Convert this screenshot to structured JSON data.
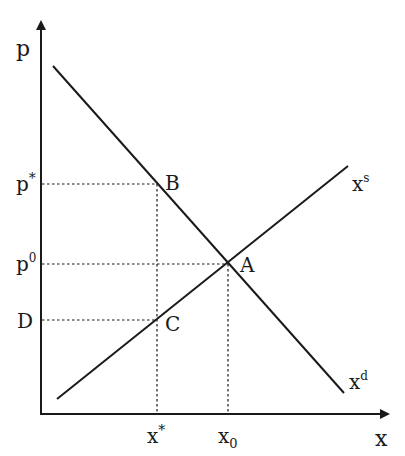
{
  "diagram": {
    "type": "supply-demand",
    "axes": {
      "y_label": "p",
      "x_label": "x"
    },
    "curves": {
      "demand": {
        "label_base": "x",
        "label_sup": "d"
      },
      "supply": {
        "label_base": "x",
        "label_sup": "s"
      }
    },
    "points": {
      "A": "A",
      "B": "B",
      "C": "C"
    },
    "y_ticks": {
      "p_star": {
        "base": "p",
        "sup": "*"
      },
      "p_zero": {
        "base": "p",
        "sup": "0"
      },
      "D": "D"
    },
    "x_ticks": {
      "x_star": {
        "base": "x",
        "sup": "*"
      },
      "x_zero": {
        "base": "x",
        "sub": "0"
      }
    },
    "colors": {
      "line": "#1a1a1a",
      "background": "#ffffff"
    }
  }
}
